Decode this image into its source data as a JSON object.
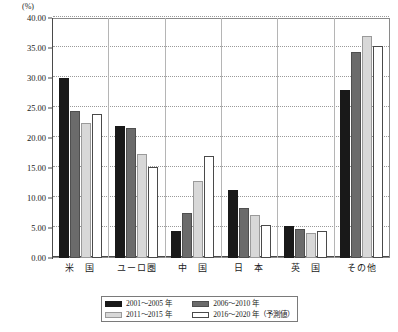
{
  "chart_data": {
    "type": "bar",
    "title": "",
    "subtitle": "",
    "unit_label": "(%)",
    "xlabel": "",
    "ylabel": "",
    "ylim": [
      0,
      40
    ],
    "ytick_step": 5,
    "ytick_labels": [
      "0.00",
      "5.00",
      "10.00",
      "15.00",
      "20.00",
      "25.00",
      "30.00",
      "35.00",
      "40.00"
    ],
    "ytick_values": [
      0,
      5,
      10,
      15,
      20,
      25,
      30,
      35,
      40
    ],
    "grid": true,
    "legend_position": "bottom",
    "categories": [
      "米　国",
      "ユーロ圏",
      "中　国",
      "日　本",
      "英　国",
      "その他"
    ],
    "series": [
      {
        "name": "2001～2005 年",
        "color": "#191919",
        "values": [
          30.0,
          22.0,
          4.5,
          11.3,
          5.3,
          28.0
        ]
      },
      {
        "name": "2006～2010 年",
        "color": "#6b6b6b",
        "values": [
          24.5,
          21.7,
          7.5,
          8.3,
          4.8,
          34.4
        ]
      },
      {
        "name": "2011～2015 年",
        "color": "#d8d8d8",
        "values": [
          22.5,
          17.3,
          12.8,
          7.1,
          4.2,
          37.0
        ]
      },
      {
        "name": "2016～2020 年（予測値）",
        "color": "#ffffff",
        "values": [
          24.0,
          15.2,
          17.0,
          5.5,
          4.5,
          35.3
        ]
      }
    ],
    "legend_entries": [
      "2001～2005 年",
      "2006～2010 年",
      "2011～2015 年",
      "2016～2020 年（予測値）"
    ]
  }
}
